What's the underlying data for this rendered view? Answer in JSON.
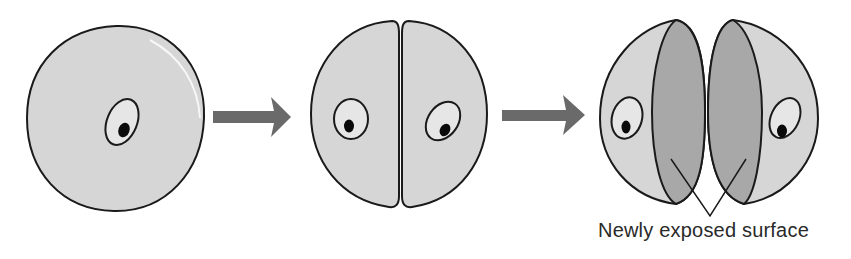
{
  "diagram": {
    "stages": [
      {
        "id": "stage-1",
        "name": "single-cell"
      },
      {
        "id": "stage-2",
        "name": "divided-cell"
      },
      {
        "id": "stage-3",
        "name": "separated-halves"
      }
    ],
    "arrows": [
      {
        "from": "stage-1",
        "to": "stage-2"
      },
      {
        "from": "stage-2",
        "to": "stage-3"
      }
    ],
    "annotation": {
      "label": "Newly exposed surface",
      "targets": [
        "left-exposed-surface",
        "right-exposed-surface"
      ]
    }
  },
  "colors": {
    "cell_fill": "#d6d6d6",
    "cell_stroke": "#1a1a1a",
    "exposed_surface": "#a8a8a8",
    "arrow": "#6a6a6a",
    "nucleus_fill": "#e6e6e6",
    "nucleolus": "#0a0a0a",
    "background": "#ffffff"
  }
}
